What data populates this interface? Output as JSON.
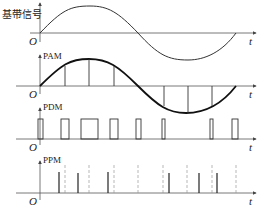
{
  "panels": [
    {
      "id": "baseband",
      "label": "基带信号",
      "origin": "O",
      "time_label": "t"
    },
    {
      "id": "pam",
      "label": "PAM",
      "origin": "O",
      "time_label": "t"
    },
    {
      "id": "pdm",
      "label": "PDM",
      "origin": "O",
      "time_label": "t"
    },
    {
      "id": "ppm",
      "label": "PPM",
      "origin": "O",
      "time_label": "t"
    }
  ],
  "colors": {
    "line": "#333333",
    "thick": "#111111",
    "dashed": "#888888",
    "axis": "#555555"
  },
  "sampling": {
    "sample_count": 8,
    "pam_sample_x": [
      65,
      89,
      114,
      137,
      160,
      184,
      208,
      231
    ],
    "pdm_pulse_widths": [
      5,
      8,
      17,
      8,
      5,
      6,
      6,
      7
    ],
    "ppm_ref_x": [
      65,
      89,
      138,
      160,
      184,
      208,
      231
    ],
    "ppm_pulse_x": [
      59,
      78,
      108,
      168,
      199,
      217
    ]
  }
}
